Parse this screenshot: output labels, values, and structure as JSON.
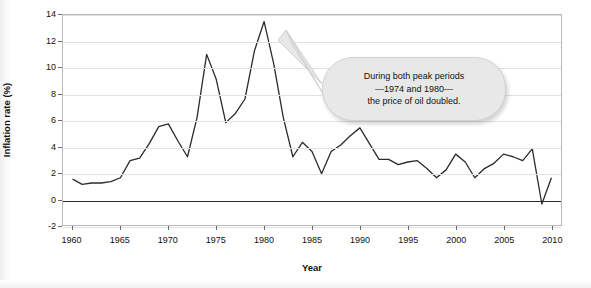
{
  "chart_data": {
    "type": "line",
    "title": "",
    "xlabel": "Year",
    "ylabel": "Inflation rate (%)",
    "xlim": [
      1959,
      2011
    ],
    "ylim": [
      -2,
      14
    ],
    "xticks": [
      1960,
      1965,
      1970,
      1975,
      1980,
      1985,
      1990,
      1995,
      2000,
      2005,
      2010
    ],
    "yticks": [
      -2,
      0,
      2,
      4,
      6,
      8,
      10,
      12,
      14
    ],
    "grid": "horizontal",
    "legend": "none",
    "series": [
      {
        "name": "Inflation rate (%)",
        "color": "#2b2b2b",
        "x": [
          1960,
          1961,
          1962,
          1963,
          1964,
          1965,
          1966,
          1967,
          1968,
          1969,
          1970,
          1971,
          1972,
          1973,
          1974,
          1975,
          1976,
          1977,
          1978,
          1979,
          1980,
          1981,
          1982,
          1983,
          1984,
          1985,
          1986,
          1987,
          1988,
          1989,
          1990,
          1991,
          1992,
          1993,
          1994,
          1995,
          1996,
          1997,
          1998,
          1999,
          2000,
          2001,
          2002,
          2003,
          2004,
          2005,
          2006,
          2007,
          2008,
          2009,
          2010
        ],
        "values": [
          1.5,
          1.1,
          1.2,
          1.2,
          1.3,
          1.6,
          2.9,
          3.1,
          4.2,
          5.5,
          5.7,
          4.4,
          3.2,
          6.2,
          11.0,
          9.1,
          5.8,
          6.5,
          7.6,
          11.3,
          13.5,
          10.3,
          6.2,
          3.2,
          4.3,
          3.6,
          1.9,
          3.6,
          4.1,
          4.8,
          5.4,
          4.2,
          3.0,
          3.0,
          2.6,
          2.8,
          2.9,
          2.3,
          1.6,
          2.2,
          3.4,
          2.8,
          1.6,
          2.3,
          2.7,
          3.4,
          3.2,
          2.9,
          3.8,
          -0.4,
          1.6
        ]
      }
    ],
    "annotation": {
      "lines": [
        "During both peak periods",
        "—1974 and 1980—",
        "the price of oil doubled."
      ],
      "pointer_targets": [
        1974,
        1980
      ]
    }
  }
}
